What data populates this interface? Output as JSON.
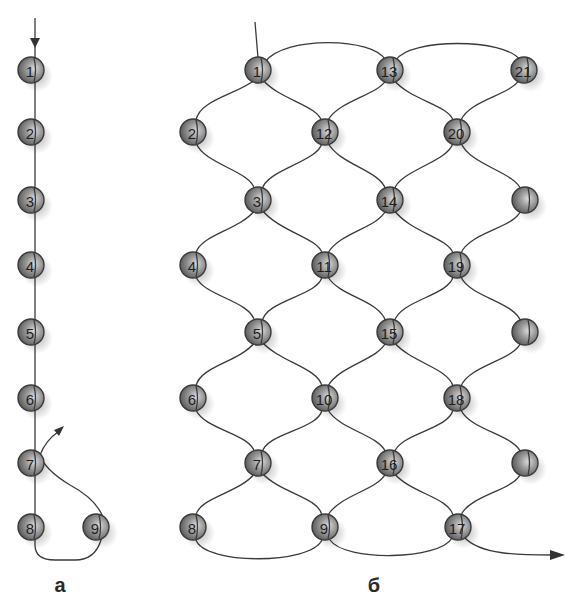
{
  "colors": {
    "thread": "#3a3a3a",
    "bead_light": "#d8d8d8",
    "bead_mid": "#8a8a8a",
    "bead_dark": "#4a4a4a",
    "label": "#2a2a2a"
  },
  "panel_a": {
    "label": "а",
    "beads": [
      {
        "n": "1",
        "x": 31,
        "y": 70
      },
      {
        "n": "2",
        "x": 31,
        "y": 132
      },
      {
        "n": "3",
        "x": 31,
        "y": 200
      },
      {
        "n": "4",
        "x": 31,
        "y": 265
      },
      {
        "n": "5",
        "x": 31,
        "y": 332
      },
      {
        "n": "6",
        "x": 31,
        "y": 398
      },
      {
        "n": "7",
        "x": 31,
        "y": 463
      },
      {
        "n": "8",
        "x": 31,
        "y": 527
      },
      {
        "n": "9",
        "x": 96,
        "y": 527
      }
    ]
  },
  "panel_b": {
    "label": "б",
    "beads": [
      {
        "n": "1",
        "x": 258,
        "y": 70
      },
      {
        "n": "2",
        "x": 193,
        "y": 132
      },
      {
        "n": "3",
        "x": 258,
        "y": 200
      },
      {
        "n": "4",
        "x": 193,
        "y": 265
      },
      {
        "n": "5",
        "x": 258,
        "y": 332
      },
      {
        "n": "6",
        "x": 193,
        "y": 398
      },
      {
        "n": "7",
        "x": 258,
        "y": 463
      },
      {
        "n": "8",
        "x": 193,
        "y": 527
      },
      {
        "n": "9",
        "x": 325,
        "y": 527
      },
      {
        "n": "10",
        "x": 325,
        "y": 398
      },
      {
        "n": "11",
        "x": 325,
        "y": 265
      },
      {
        "n": "12",
        "x": 325,
        "y": 132
      },
      {
        "n": "13",
        "x": 390,
        "y": 70
      },
      {
        "n": "14",
        "x": 390,
        "y": 200
      },
      {
        "n": "15",
        "x": 390,
        "y": 332
      },
      {
        "n": "16",
        "x": 390,
        "y": 463
      },
      {
        "n": "17",
        "x": 458,
        "y": 527
      },
      {
        "n": "18",
        "x": 457,
        "y": 398
      },
      {
        "n": "19",
        "x": 457,
        "y": 265
      },
      {
        "n": "20",
        "x": 457,
        "y": 132
      },
      {
        "n": "21",
        "x": 524,
        "y": 70
      },
      {
        "n": "",
        "x": 525,
        "y": 200
      },
      {
        "n": "",
        "x": 525,
        "y": 332
      },
      {
        "n": "",
        "x": 525,
        "y": 463
      }
    ]
  }
}
